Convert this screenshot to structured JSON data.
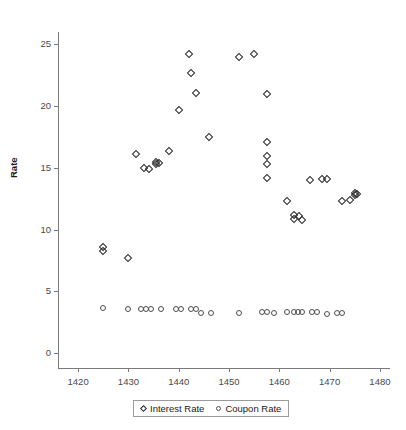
{
  "chart_data": {
    "type": "scatter",
    "title": "",
    "xlabel": "",
    "ylabel": "Rate",
    "xlim": [
      1416,
      1482
    ],
    "ylim": [
      -1.2,
      26.0
    ],
    "xticks": [
      1420,
      1430,
      1440,
      1450,
      1460,
      1470,
      1480
    ],
    "xtick_labels": [
      "1420",
      "1430",
      "1440",
      "1450",
      "1460",
      "1470",
      "1480"
    ],
    "yticks": [
      0,
      5,
      10,
      15,
      20,
      25
    ],
    "ytick_labels": [
      "0",
      "5",
      "10",
      "15",
      "20",
      "25"
    ],
    "grid": false,
    "legend_position": "bottom",
    "series": [
      {
        "name": "Interest Rate",
        "marker": "diamond",
        "color": "#2b2b2b",
        "points": [
          [
            1425.0,
            8.6
          ],
          [
            1425.0,
            8.3
          ],
          [
            1430.0,
            7.7
          ],
          [
            1431.5,
            16.1
          ],
          [
            1433.0,
            15.0
          ],
          [
            1434.0,
            14.9
          ],
          [
            1435.5,
            15.5
          ],
          [
            1435.5,
            15.3
          ],
          [
            1436.0,
            15.4
          ],
          [
            1438.0,
            16.4
          ],
          [
            1440.0,
            19.7
          ],
          [
            1442.0,
            24.2
          ],
          [
            1442.5,
            22.7
          ],
          [
            1443.5,
            21.1
          ],
          [
            1446.0,
            17.5
          ],
          [
            1452.0,
            24.0
          ],
          [
            1455.0,
            24.2
          ],
          [
            1457.5,
            21.0
          ],
          [
            1457.5,
            17.1
          ],
          [
            1457.5,
            16.0
          ],
          [
            1457.5,
            15.3
          ],
          [
            1457.5,
            14.2
          ],
          [
            1461.5,
            12.3
          ],
          [
            1463.0,
            11.2
          ],
          [
            1463.0,
            10.9
          ],
          [
            1464.0,
            11.1
          ],
          [
            1464.5,
            10.8
          ],
          [
            1466.0,
            14.0
          ],
          [
            1468.5,
            14.1
          ],
          [
            1469.5,
            14.1
          ],
          [
            1472.5,
            12.3
          ],
          [
            1474.0,
            12.4
          ],
          [
            1475.0,
            13.0
          ],
          [
            1475.0,
            12.8
          ],
          [
            1475.5,
            12.9
          ]
        ]
      },
      {
        "name": "Coupon Rate",
        "marker": "circle",
        "color": "#4d4d4d",
        "points": [
          [
            1425.0,
            3.65
          ],
          [
            1430.0,
            3.6
          ],
          [
            1432.5,
            3.6
          ],
          [
            1433.5,
            3.6
          ],
          [
            1434.5,
            3.6
          ],
          [
            1436.5,
            3.6
          ],
          [
            1439.5,
            3.6
          ],
          [
            1440.5,
            3.6
          ],
          [
            1442.5,
            3.6
          ],
          [
            1443.5,
            3.6
          ],
          [
            1444.5,
            3.25
          ],
          [
            1446.5,
            3.25
          ],
          [
            1452.0,
            3.25
          ],
          [
            1456.5,
            3.3
          ],
          [
            1457.5,
            3.3
          ],
          [
            1459.0,
            3.25
          ],
          [
            1461.5,
            3.3
          ],
          [
            1463.0,
            3.3
          ],
          [
            1463.8,
            3.3
          ],
          [
            1464.6,
            3.3
          ],
          [
            1466.5,
            3.3
          ],
          [
            1467.5,
            3.3
          ],
          [
            1469.5,
            3.2
          ],
          [
            1471.5,
            3.25
          ],
          [
            1472.5,
            3.25
          ]
        ]
      }
    ]
  },
  "legend": {
    "items": [
      {
        "label": "Interest Rate",
        "marker": "diamond"
      },
      {
        "label": "Coupon Rate",
        "marker": "circle"
      }
    ]
  }
}
